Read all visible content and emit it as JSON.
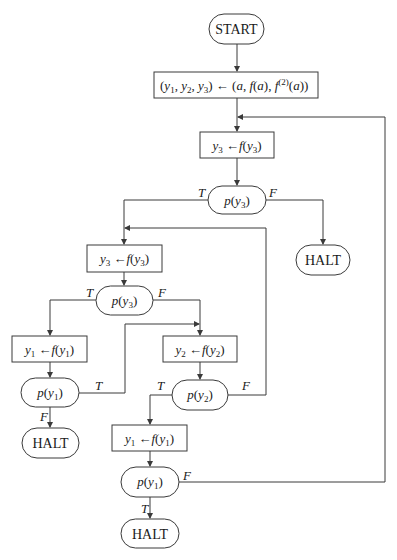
{
  "diagram": {
    "type": "flowchart",
    "nodes": {
      "start": {
        "label": "START",
        "shape": "terminal"
      },
      "init": {
        "label": "(y1, y2, y3) ← (a, f(a), f(2)(a))",
        "shape": "process"
      },
      "step1": {
        "label": "y3 ← f(y3)",
        "shape": "process"
      },
      "test1": {
        "label": "p(y3)",
        "shape": "decision"
      },
      "halt1": {
        "label": "HALT",
        "shape": "terminal"
      },
      "step2": {
        "label": "y3 ← f(y3)",
        "shape": "process"
      },
      "test2": {
        "label": "p(y3)",
        "shape": "decision"
      },
      "step3": {
        "label": "y1 ← f(y1)",
        "shape": "process"
      },
      "test3": {
        "label": "p(y1)",
        "shape": "decision"
      },
      "halt2": {
        "label": "HALT",
        "shape": "terminal"
      },
      "step4": {
        "label": "y2 ← f(y2)",
        "shape": "process"
      },
      "test4": {
        "label": "p(y2)",
        "shape": "decision"
      },
      "step5": {
        "label": "y1 ← f(y1)",
        "shape": "process"
      },
      "test5": {
        "label": "p(y1)",
        "shape": "decision"
      },
      "halt3": {
        "label": "HALT",
        "shape": "terminal"
      }
    },
    "edges": [
      {
        "from": "start",
        "to": "init",
        "label": ""
      },
      {
        "from": "init",
        "to": "step1",
        "label": ""
      },
      {
        "from": "step1",
        "to": "test1",
        "label": ""
      },
      {
        "from": "test1",
        "to": "step2",
        "label": "T"
      },
      {
        "from": "test1",
        "to": "halt1",
        "label": "F"
      },
      {
        "from": "step2",
        "to": "test2",
        "label": ""
      },
      {
        "from": "test2",
        "to": "step3",
        "label": "T"
      },
      {
        "from": "test2",
        "to": "step4",
        "label": "F"
      },
      {
        "from": "step3",
        "to": "test3",
        "label": ""
      },
      {
        "from": "test3",
        "to": "halt2",
        "label": "F"
      },
      {
        "from": "test3",
        "to": "step4",
        "label": "T"
      },
      {
        "from": "step4",
        "to": "test4",
        "label": ""
      },
      {
        "from": "test4",
        "to": "step5",
        "label": "T"
      },
      {
        "from": "test4",
        "to": "step2",
        "label": "F"
      },
      {
        "from": "step5",
        "to": "test5",
        "label": ""
      },
      {
        "from": "test5",
        "to": "halt3",
        "label": "T"
      },
      {
        "from": "test5",
        "to": "step1",
        "label": "F"
      }
    ],
    "branch_labels": {
      "true": "T",
      "false": "F"
    },
    "text": {
      "start": "START",
      "halt": "HALT",
      "arrow": "←",
      "p": "p",
      "f": "f",
      "y": "y",
      "a": "a",
      "sup2": "(2)",
      "s1": "1",
      "s2": "2",
      "s3": "3"
    }
  }
}
